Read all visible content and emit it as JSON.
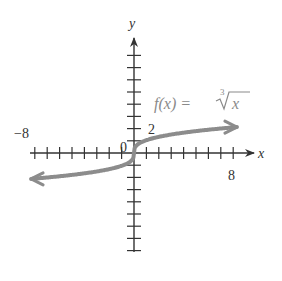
{
  "chart_data": {
    "type": "line",
    "title": "",
    "function_label": "f(x) = ∛ x",
    "function_label_parts": {
      "lhs": "f(x) =",
      "root_index": "3",
      "radicand": "x"
    },
    "xlabel": "x",
    "ylabel": "y",
    "xlim": [
      -8,
      8
    ],
    "ylim": [
      -8,
      8
    ],
    "x_tick_step": 1,
    "y_tick_step": 1,
    "tick_labels": {
      "x_min": "−8",
      "x_max": "8",
      "origin": "0",
      "y_marked": "2"
    },
    "series": [
      {
        "name": "f(x) = cube root of x",
        "x": [
          -8,
          -6,
          -4,
          -2,
          -1,
          -0.5,
          0,
          0.5,
          1,
          2,
          4,
          6,
          8
        ],
        "y": [
          -2,
          -1.817,
          -1.587,
          -1.26,
          -1,
          -0.794,
          0,
          0.794,
          1,
          1.26,
          1.587,
          1.817,
          2
        ],
        "color": "#8c8c8c"
      }
    ],
    "grid": false,
    "legend": "none"
  },
  "colors": {
    "axis": "#333333",
    "curve": "#8c8c8c",
    "background": "#ffffff"
  }
}
